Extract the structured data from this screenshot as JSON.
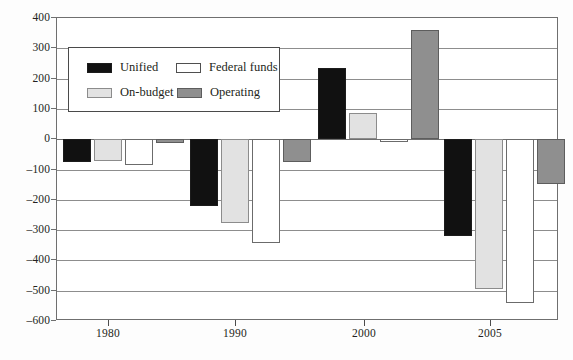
{
  "chart_data": {
    "type": "bar",
    "title": "",
    "subtitle": "",
    "xlabel": "",
    "ylabel": "",
    "categories": [
      "1980",
      "1990",
      "2000",
      "2005"
    ],
    "ylim": [
      -600,
      400
    ],
    "ytick_labels": [
      "400",
      "300",
      "200",
      "100",
      "0",
      "–100",
      "–200",
      "–300",
      "–400",
      "–500",
      "–600"
    ],
    "ytick_values": [
      400,
      300,
      200,
      100,
      0,
      -100,
      -200,
      -300,
      -400,
      -500,
      -600
    ],
    "grid": true,
    "legend_position": "upper-left-inside",
    "series": [
      {
        "name": "Unified",
        "color": "#111111",
        "values": [
          -74,
          -221,
          236,
          -318
        ]
      },
      {
        "name": "On-budget",
        "color": "#e2e2e2",
        "values": [
          -72,
          -277,
          86,
          -494
        ]
      },
      {
        "name": "Federal funds",
        "color": "#ffffff",
        "values": [
          -85,
          -344,
          -9,
          -542
        ]
      },
      {
        "name": "Operating",
        "color": "#8f8f8f",
        "values": [
          -11,
          -76,
          359,
          -147
        ]
      }
    ]
  },
  "legend": {
    "entries": [
      {
        "label": "Unified",
        "swatch": "unified-swatch"
      },
      {
        "label": "On-budget",
        "swatch": "onbudget-swatch"
      },
      {
        "label": "Federal funds",
        "swatch": "federal-funds-swatch"
      },
      {
        "label": "Operating",
        "swatch": "operating-swatch"
      }
    ]
  },
  "axes": {
    "y_ticks": [
      {
        "label": "400",
        "value": 400
      },
      {
        "label": "300",
        "value": 300
      },
      {
        "label": "200",
        "value": 200
      },
      {
        "label": "100",
        "value": 100
      },
      {
        "label": "0",
        "value": 0
      },
      {
        "label": "–100",
        "value": -100
      },
      {
        "label": "–200",
        "value": -200
      },
      {
        "label": "–300",
        "value": -300
      },
      {
        "label": "–400",
        "value": -400
      },
      {
        "label": "–500",
        "value": -500
      },
      {
        "label": "–600",
        "value": -600
      }
    ],
    "x_ticks": [
      {
        "label": "1980",
        "pos": 108
      },
      {
        "label": "1990",
        "pos": 235
      },
      {
        "label": "2000",
        "pos": 364
      },
      {
        "label": "2005",
        "pos": 490
      }
    ]
  },
  "layout": {
    "group_starts": [
      62,
      189,
      317,
      443
    ],
    "bar_width": 28,
    "bar_gap": 3
  }
}
